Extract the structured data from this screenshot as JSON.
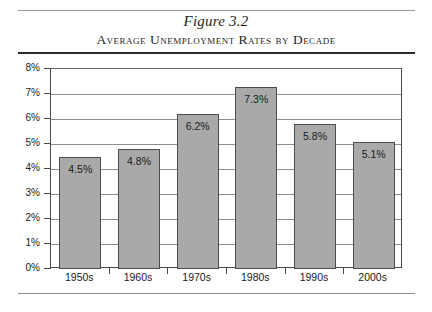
{
  "figure": {
    "number": "Figure 3.2",
    "title": "Average Unemployment Rates by Decade"
  },
  "chart_data": {
    "type": "bar",
    "title": "Average Unemployment Rates by Decade",
    "subtitle": "Figure 3.2",
    "categories": [
      "1950s",
      "1960s",
      "1970s",
      "1980s",
      "1990s",
      "2000s"
    ],
    "values": [
      4.5,
      4.8,
      6.2,
      7.3,
      5.8,
      5.1
    ],
    "value_labels": [
      "4.5%",
      "4.8%",
      "6.2%",
      "7.3%",
      "5.8%",
      "5.1%"
    ],
    "xlabel": "",
    "ylabel": "",
    "ylim": [
      0,
      8
    ],
    "ytick_values": [
      0,
      1,
      2,
      3,
      4,
      5,
      6,
      7,
      8
    ],
    "ytick_labels": [
      "0%",
      "1%",
      "2%",
      "3%",
      "4%",
      "5%",
      "6%",
      "7%",
      "8%"
    ],
    "grid": true,
    "grid_axis": "y",
    "legend": false,
    "bar_color": "#a9a9a9",
    "bar_edge_color": "#4d4d4d",
    "grid_color": "#8d8d8d",
    "axis_color": "#4a4a4a",
    "background_color": "#ffffff"
  }
}
